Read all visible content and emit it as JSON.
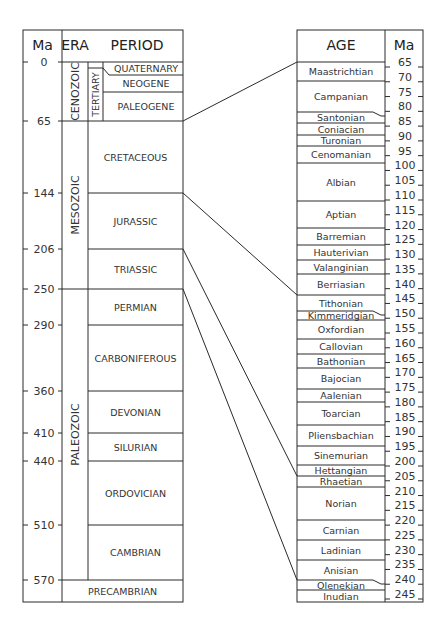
{
  "left_table": {
    "headers": {
      "ma": "Ma",
      "era": "ERA",
      "period": "PERIOD"
    },
    "ma_ticks": [
      {
        "label": "0",
        "y": 62
      },
      {
        "label": "65",
        "y": 121
      },
      {
        "label": "144",
        "y": 193
      },
      {
        "label": "206",
        "y": 249
      },
      {
        "label": "250",
        "y": 289
      },
      {
        "label": "290",
        "y": 325
      },
      {
        "label": "360",
        "y": 391
      },
      {
        "label": "410",
        "y": 433
      },
      {
        "label": "440",
        "y": 461
      },
      {
        "label": "510",
        "y": 525
      },
      {
        "label": "570",
        "y": 580
      }
    ],
    "eras": [
      {
        "label": "CENOZOIC",
        "y0": 62,
        "y1": 121
      },
      {
        "label": "MESOZOIC",
        "y0": 121,
        "y1": 289
      },
      {
        "label": "PALEOZOIC",
        "y0": 289,
        "y1": 580
      }
    ],
    "subera": {
      "label": "TERTIARY",
      "y0": 68,
      "y1": 121
    },
    "periods": [
      {
        "label": "QUATERNARY",
        "y0": 62,
        "y1": 75
      },
      {
        "label": "NEOGENE",
        "y0": 75,
        "y1": 92
      },
      {
        "label": "PALEOGENE",
        "y0": 92,
        "y1": 121
      },
      {
        "label": "CRETACEOUS",
        "y0": 121,
        "y1": 193
      },
      {
        "label": "JURASSIC",
        "y0": 193,
        "y1": 249
      },
      {
        "label": "TRIASSIC",
        "y0": 249,
        "y1": 289
      },
      {
        "label": "PERMIAN",
        "y0": 289,
        "y1": 325
      },
      {
        "label": "CARBONIFEROUS",
        "y0": 325,
        "y1": 391
      },
      {
        "label": "DEVONIAN",
        "y0": 391,
        "y1": 433
      },
      {
        "label": "SILURIAN",
        "y0": 433,
        "y1": 461
      },
      {
        "label": "ORDOVICIAN",
        "y0": 461,
        "y1": 525
      },
      {
        "label": "CAMBRIAN",
        "y0": 525,
        "y1": 580
      },
      {
        "label": "PRECAMBRIAN",
        "y0": 580,
        "y1": 602
      }
    ]
  },
  "right_table": {
    "headers": {
      "age": "AGE",
      "ma": "Ma"
    },
    "ma_ticks": [
      "65",
      "70",
      "75",
      "80",
      "85",
      "90",
      "95",
      "100",
      "105",
      "110",
      "115",
      "120",
      "125",
      "130",
      "135",
      "140",
      "145",
      "150",
      "155",
      "160",
      "165",
      "170",
      "175",
      "180",
      "185",
      "190",
      "195",
      "200",
      "205",
      "210",
      "215",
      "220",
      "225",
      "230",
      "235",
      "240",
      "245"
    ],
    "ages": [
      {
        "label": "Maastrichtian",
        "y0": 62,
        "y1": 81
      },
      {
        "label": "Campanian",
        "y0": 81,
        "y1": 112
      },
      {
        "label": "Santonian",
        "y0": 112,
        "y1": 123
      },
      {
        "label": "Coniacian",
        "y0": 123,
        "y1": 135
      },
      {
        "label": "Turonian",
        "y0": 135,
        "y1": 146
      },
      {
        "label": "Cenomanian",
        "y0": 146,
        "y1": 163
      },
      {
        "label": "Albian",
        "y0": 163,
        "y1": 201
      },
      {
        "label": "Aptian",
        "y0": 201,
        "y1": 228
      },
      {
        "label": "Barremian",
        "y0": 228,
        "y1": 245
      },
      {
        "label": "Hauterivian",
        "y0": 245,
        "y1": 260
      },
      {
        "label": "Valanginian",
        "y0": 260,
        "y1": 274
      },
      {
        "label": "Berriasian",
        "y0": 274,
        "y1": 295
      },
      {
        "label": "Tithonian",
        "y0": 295,
        "y1": 311
      },
      {
        "label": "Kimmeridgian",
        "y0": 311,
        "y1": 320
      },
      {
        "label": "Oxfordian",
        "y0": 320,
        "y1": 339
      },
      {
        "label": "Callovian",
        "y0": 339,
        "y1": 354
      },
      {
        "label": "Bathonian",
        "y0": 354,
        "y1": 368
      },
      {
        "label": "Bajocian",
        "y0": 368,
        "y1": 389
      },
      {
        "label": "Aalenian",
        "y0": 389,
        "y1": 402
      },
      {
        "label": "Toarcian",
        "y0": 402,
        "y1": 425
      },
      {
        "label": "Pliensbachian",
        "y0": 425,
        "y1": 446
      },
      {
        "label": "Sinemurian",
        "y0": 446,
        "y1": 465
      },
      {
        "label": "Hettangian",
        "y0": 465,
        "y1": 476
      },
      {
        "label": "Rhaetian",
        "y0": 476,
        "y1": 487
      },
      {
        "label": "Norian",
        "y0": 487,
        "y1": 520
      },
      {
        "label": "Carnian",
        "y0": 520,
        "y1": 540
      },
      {
        "label": "Ladinian",
        "y0": 540,
        "y1": 560
      },
      {
        "label": "Anisian",
        "y0": 560,
        "y1": 580
      },
      {
        "label": "Olenekian",
        "y0": 580,
        "y1": 590
      },
      {
        "label": "Inudian",
        "y0": 590,
        "y1": 602
      }
    ]
  },
  "connectors": [
    {
      "from_y": 121,
      "to_y": 62,
      "label": "65 Ma"
    },
    {
      "from_y": 193,
      "to_y": 295,
      "label": "144 Ma"
    },
    {
      "from_y": 249,
      "to_y": 476,
      "label": "206 Ma"
    },
    {
      "from_y": 289,
      "to_y": 580,
      "label": "250 Ma"
    }
  ]
}
